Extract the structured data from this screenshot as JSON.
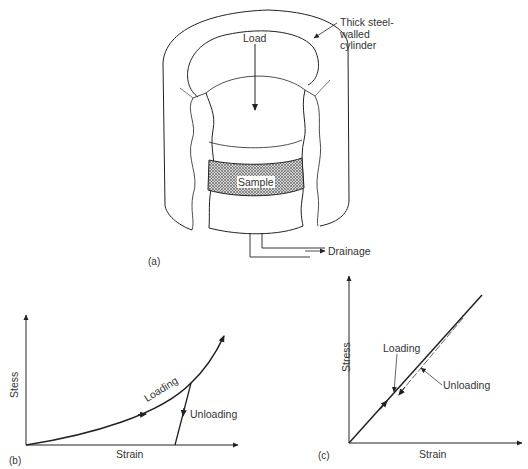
{
  "figure": {
    "panel_a": {
      "tag": "(a)",
      "labels": {
        "load": "Load",
        "cylinder": "Thick steel-\nwalled\ncylinder",
        "sample": "Sample",
        "drainage": "Drainage"
      }
    },
    "panel_b": {
      "tag": "(b)",
      "y_axis": "Stess",
      "x_axis": "Strain",
      "curves": {
        "loading": "Loading",
        "unloading": "Unloading"
      }
    },
    "panel_c": {
      "tag": "(c)",
      "y_axis": "Stress",
      "x_axis": "Strain",
      "curves": {
        "loading": "Loading",
        "unloading": "Unloading"
      }
    }
  },
  "colors": {
    "line": "#222222",
    "hatch": "#555555",
    "background": "#ffffff"
  }
}
